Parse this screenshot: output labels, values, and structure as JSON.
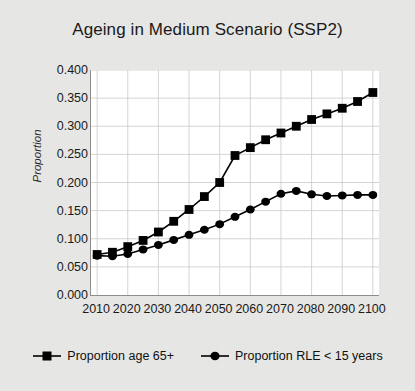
{
  "chart_data": {
    "type": "line",
    "title": "Ageing in Medium Scenario (SSP2)",
    "xlabel": "",
    "ylabel": "Proportion",
    "xlim": [
      2008,
      2102
    ],
    "ylim": [
      0.0,
      0.4
    ],
    "grid": true,
    "legend_position": "bottom",
    "ytick_labels": [
      "0.400",
      "0.350",
      "0.300",
      "0.250",
      "0.200",
      "0.150",
      "0.100",
      "0.050",
      "0.000"
    ],
    "ytick_values": [
      0.4,
      0.35,
      0.3,
      0.25,
      0.2,
      0.15,
      0.1,
      0.05,
      0.0
    ],
    "xtick_labels": [
      "2010",
      "2020",
      "2030",
      "2040",
      "2050",
      "2060",
      "2070",
      "2080",
      "2090",
      "2100"
    ],
    "xtick_values": [
      2010,
      2020,
      2030,
      2040,
      2050,
      2060,
      2070,
      2080,
      2090,
      2100
    ],
    "x": [
      2010,
      2015,
      2020,
      2025,
      2030,
      2035,
      2040,
      2045,
      2050,
      2055,
      2060,
      2065,
      2070,
      2075,
      2080,
      2085,
      2090,
      2095,
      2100
    ],
    "series": [
      {
        "name": "Proportion age 65+",
        "marker": "square",
        "color": "#000000",
        "values": [
          0.072,
          0.076,
          0.086,
          0.097,
          0.112,
          0.131,
          0.152,
          0.175,
          0.2,
          0.248,
          0.262,
          0.276,
          0.288,
          0.3,
          0.312,
          0.322,
          0.332,
          0.344,
          0.36
        ]
      },
      {
        "name": "Proportion RLE < 15 years",
        "marker": "circle",
        "color": "#000000",
        "values": [
          0.07,
          0.069,
          0.073,
          0.081,
          0.089,
          0.098,
          0.107,
          0.116,
          0.126,
          0.139,
          0.152,
          0.166,
          0.18,
          0.185,
          0.179,
          0.176,
          0.177,
          0.178,
          0.178
        ]
      }
    ]
  },
  "legend": {
    "items": [
      {
        "label": "Proportion age 65+",
        "marker": "square"
      },
      {
        "label": "Proportion RLE < 15 years",
        "marker": "circle"
      }
    ]
  }
}
